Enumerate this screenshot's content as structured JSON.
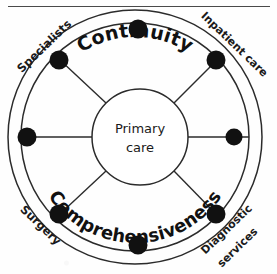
{
  "figure": {
    "name": "primary-care-hub-diagram",
    "type": "concentric-ring hub and spoke diagram",
    "center": {
      "line1": "Primary",
      "line2": "care"
    },
    "ring_labels": {
      "top": "Continuity",
      "bottom": "Comprehensiveness"
    },
    "outer_labels": [
      {
        "id": "specialists",
        "text": "Specialists",
        "position": "north-west"
      },
      {
        "id": "inpatient-care",
        "text": "Inpatient care",
        "position": "north-east"
      },
      {
        "id": "diagnostic-services",
        "line1": "Diagnostic",
        "line2": "services",
        "position": "south-east"
      },
      {
        "id": "surgery",
        "text": "Surgery",
        "position": "south-west"
      }
    ],
    "nodes": [
      {
        "id": "node-n",
        "angle_deg": 270,
        "label": ""
      },
      {
        "id": "node-ne",
        "angle_deg": 315,
        "label": "Inpatient care"
      },
      {
        "id": "node-e",
        "angle_deg": 0,
        "label": ""
      },
      {
        "id": "node-se",
        "angle_deg": 45,
        "label": "Diagnostic services"
      },
      {
        "id": "node-s",
        "angle_deg": 90,
        "label": ""
      },
      {
        "id": "node-sw",
        "angle_deg": 135,
        "label": "Surgery"
      },
      {
        "id": "node-w",
        "angle_deg": 180,
        "label": ""
      },
      {
        "id": "node-nw",
        "angle_deg": 225,
        "label": "Specialists"
      }
    ],
    "colors": {
      "ink": "#1a1a1a",
      "stroke": "#2b2b2b",
      "node_fill": "#111111",
      "background": "#ffffff"
    }
  }
}
